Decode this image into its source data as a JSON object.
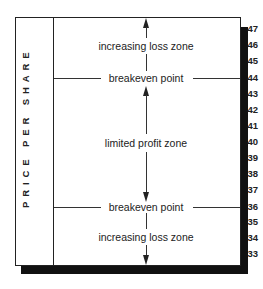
{
  "diagram": {
    "axis_label": "PRICE PER SHARE",
    "ticks": [
      "47",
      "46",
      "45",
      "44",
      "43",
      "42",
      "41",
      "40",
      "39",
      "38",
      "37",
      "36",
      "35",
      "34",
      "33"
    ],
    "zones": {
      "upper_loss": "increasing loss zone",
      "upper_breakeven": "breakeven point",
      "profit": "limited profit zone",
      "lower_breakeven": "breakeven point",
      "lower_loss": "increasing loss zone"
    },
    "breakeven_prices": [
      44,
      36
    ],
    "colors": {
      "line": "#333333",
      "shadow": "#111111",
      "background": "#ffffff"
    }
  }
}
